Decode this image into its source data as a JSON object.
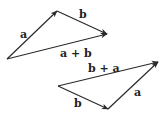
{
  "diagram": {
    "colors": {
      "stroke": "#2a2a2a",
      "text": "#222222",
      "background": "#ffffff"
    },
    "top_triangle": {
      "origin": [
        7,
        59
      ],
      "vectors": [
        {
          "id": "a",
          "label": "a",
          "from": [
            7,
            59
          ],
          "to": [
            57,
            11
          ]
        },
        {
          "id": "b",
          "label": "b",
          "from": [
            57,
            11
          ],
          "to": [
            107,
            34
          ]
        },
        {
          "id": "sum",
          "label": "a + b",
          "from": [
            7,
            59
          ],
          "to": [
            107,
            34
          ]
        }
      ],
      "labels": {
        "a": "a",
        "b": "b",
        "sum": "a + b"
      }
    },
    "bottom_triangle": {
      "origin": [
        58,
        86
      ],
      "vectors": [
        {
          "id": "b",
          "label": "b",
          "from": [
            58,
            86
          ],
          "to": [
            108,
            109
          ]
        },
        {
          "id": "a",
          "label": "a",
          "from": [
            108,
            109
          ],
          "to": [
            158,
            62
          ]
        },
        {
          "id": "sum",
          "label": "b + a",
          "from": [
            58,
            86
          ],
          "to": [
            158,
            62
          ]
        }
      ],
      "labels": {
        "a": "a",
        "b": "b",
        "sum": "b + a"
      }
    }
  }
}
